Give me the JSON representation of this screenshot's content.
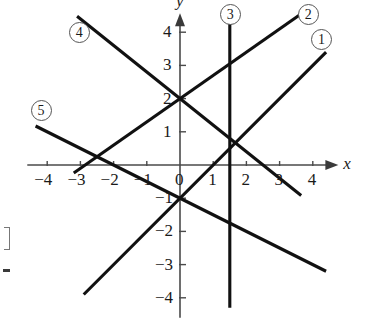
{
  "chart_data": {
    "type": "line",
    "title": "",
    "xlabel": "x",
    "ylabel": "y",
    "xlim": [
      -4.6,
      4.8
    ],
    "ylim": [
      -4.6,
      4.6
    ],
    "grid": false,
    "legend": "inline-circled-numbers",
    "x_ticks": [
      -4,
      -3,
      -2,
      -1,
      0,
      1,
      2,
      3,
      4
    ],
    "x_tick_labels": [
      "−4",
      "−3",
      "−2",
      "−1",
      "0",
      "1",
      "2",
      "3",
      "4"
    ],
    "y_ticks": [
      -4,
      -3,
      -2,
      -1,
      1,
      2,
      3,
      4
    ],
    "y_tick_labels": [
      "−4",
      "−3",
      "−2",
      "−1",
      "1",
      "2",
      "3",
      "4"
    ],
    "axis_arrows": [
      "x-positive",
      "y-positive"
    ],
    "series": [
      {
        "name": "1",
        "label": "①",
        "kind": "line",
        "slope": 1,
        "intercept": -1,
        "equation": "y = x − 1",
        "x_start": -2.9,
        "x_end": 4.4,
        "label_x": 4.25,
        "label_y": 3.8
      },
      {
        "name": "2",
        "label": "②",
        "kind": "line",
        "slope": 0.7,
        "intercept": 2,
        "equation": "y = 0.7x + 2",
        "x_start": -3.2,
        "x_end": 3.6,
        "label_x": 3.85,
        "label_y": 4.55
      },
      {
        "name": "3",
        "label": "③",
        "kind": "vertical",
        "x_value": 1.5,
        "equation": "x = 1.5",
        "y_start": -4.3,
        "y_end": 4.3,
        "label_x": 1.5,
        "label_y": 4.55
      },
      {
        "name": "4",
        "label": "④",
        "kind": "line",
        "slope": -0.8,
        "intercept": 2,
        "equation": "y = −0.8x + 2",
        "x_start": -3.1,
        "x_end": 3.65,
        "label_x": -3.05,
        "label_y": 4.0
      },
      {
        "name": "5",
        "label": "⑤",
        "kind": "line",
        "slope": -0.5,
        "intercept": -1,
        "equation": "y = −0.5x − 1",
        "x_start": -4.35,
        "x_end": 4.4,
        "label_x": -4.2,
        "label_y": 1.65
      }
    ],
    "key_points": [
      {
        "x": 0,
        "y": 2,
        "note": "intersection of line 2 and line 4"
      },
      {
        "x": 0,
        "y": -1,
        "note": "intersection of line 1 and line 5"
      }
    ]
  },
  "axes": {
    "x_label": "x",
    "y_label": "y"
  },
  "geometry": {
    "origin_x": 180,
    "origin_y": 165,
    "unit_px": 33.2
  }
}
